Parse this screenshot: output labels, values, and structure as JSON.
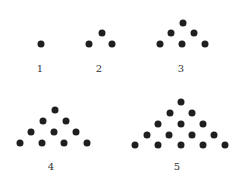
{
  "diagram": {
    "dot_color": "#1f1f1f",
    "figures": [
      {
        "label": "1",
        "label_pos": [
          40,
          68
        ],
        "dots": [
          [
            41,
            44
          ]
        ]
      },
      {
        "label": "2",
        "label_pos": [
          99,
          68
        ],
        "dots": [
          [
            102,
            33
          ],
          [
            89,
            44
          ],
          [
            112,
            44
          ]
        ]
      },
      {
        "label": "3",
        "label_pos": [
          181,
          68
        ],
        "dots": [
          [
            183,
            23
          ],
          [
            171,
            33
          ],
          [
            194,
            33
          ],
          [
            160,
            44
          ],
          [
            182,
            44
          ],
          [
            205,
            44
          ]
        ]
      },
      {
        "label": "4",
        "label_pos": [
          51,
          166
        ],
        "dots": [
          [
            55,
            110
          ],
          [
            43,
            121
          ],
          [
            66,
            121
          ],
          [
            31,
            132
          ],
          [
            54,
            132
          ],
          [
            76,
            132
          ],
          [
            20,
            143
          ],
          [
            42,
            143
          ],
          [
            64,
            143
          ],
          [
            87,
            143
          ]
        ]
      },
      {
        "label": "5",
        "label_pos": [
          177,
          166
        ],
        "dots": [
          [
            181,
            102
          ],
          [
            170,
            113
          ],
          [
            192,
            113
          ],
          [
            158,
            124
          ],
          [
            181,
            124
          ],
          [
            203,
            124
          ],
          [
            147,
            135
          ],
          [
            169,
            135
          ],
          [
            192,
            135
          ],
          [
            214,
            135
          ],
          [
            135,
            145
          ],
          [
            158,
            145
          ],
          [
            181,
            145
          ],
          [
            203,
            145
          ],
          [
            225,
            145
          ]
        ]
      }
    ]
  }
}
